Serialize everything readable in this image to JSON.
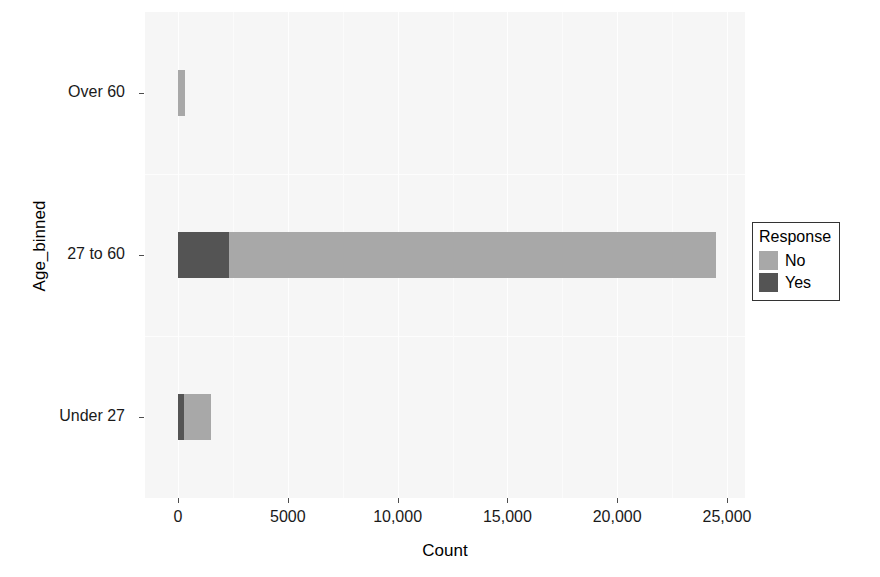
{
  "chart_data": {
    "type": "bar",
    "orientation": "horizontal",
    "stacked": true,
    "title": "",
    "xlabel": "Count",
    "ylabel": "Age_binned",
    "categories": [
      "Over 60",
      "27 to 60",
      "Under 27"
    ],
    "series": [
      {
        "name": "No",
        "color": "#a8a8a8",
        "values": [
          310,
          22180,
          1230
        ]
      },
      {
        "name": "Yes",
        "color": "#545454",
        "values": [
          10,
          2320,
          270
        ]
      }
    ],
    "totals": [
      320,
      24500,
      1500
    ],
    "legend": {
      "title": "Response",
      "position": "right",
      "entries": [
        {
          "label": "No",
          "color": "#a8a8a8"
        },
        {
          "label": "Yes",
          "color": "#545454"
        }
      ]
    },
    "xlim": [
      -700,
      26600
    ],
    "xticks": [
      0,
      5000,
      10000,
      15000,
      20000,
      25000
    ],
    "xticklabels": [
      "0",
      "5000",
      "10,000",
      "15,000",
      "20,000",
      "25,000"
    ],
    "xminorticks": [
      2500,
      7500,
      12500,
      17500,
      22500
    ],
    "grid": true,
    "panel_background": "#f6f6f6",
    "grid_color": "#ffffff"
  }
}
